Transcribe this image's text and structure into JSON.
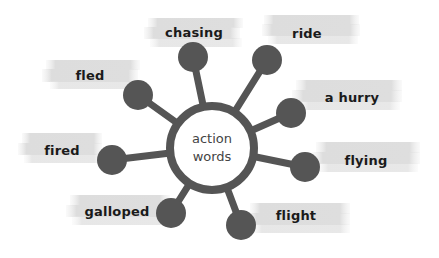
{
  "center": {
    "line1": "action",
    "line2": "words"
  },
  "words": [
    {
      "id": "chasing",
      "label": "chasing"
    },
    {
      "id": "ride",
      "label": "ride"
    },
    {
      "id": "fled",
      "label": "fled"
    },
    {
      "id": "a-hurry",
      "label": "a hurry"
    },
    {
      "id": "fired",
      "label": "fired"
    },
    {
      "id": "flying",
      "label": "flying"
    },
    {
      "id": "galloped",
      "label": "galloped"
    },
    {
      "id": "flight",
      "label": "flight"
    }
  ],
  "colors": {
    "node": "#555555",
    "highlight": "#e2e2e2",
    "text": "#1a1a1a"
  }
}
